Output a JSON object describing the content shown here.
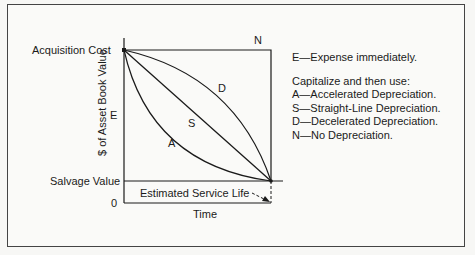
{
  "diagram": {
    "y_axis_label": "$ of Asset Book Value",
    "x_axis_label": "Time",
    "acquisition_cost_label": "Acquisition Cost",
    "salvage_value_label": "Salvage Value",
    "zero_label": "0",
    "service_life_label": "Estimated Service Life",
    "curve_labels": {
      "N": "N",
      "E": "E",
      "D": "D",
      "S": "S",
      "A": "A"
    }
  },
  "legend": {
    "expense": "E—Expense immediately.",
    "capitalize_heading": "Capitalize and then use:",
    "items": [
      "A—Accelerated Depreciation.",
      "S—Straight-Line Depreciation.",
      "D—Decelerated Depreciation.",
      "N—No Depreciation."
    ]
  }
}
